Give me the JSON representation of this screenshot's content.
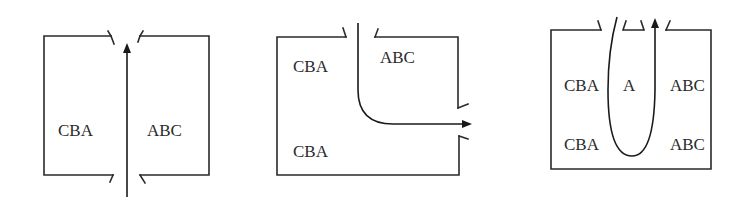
{
  "diagram": {
    "panels": [
      {
        "id": "straight-through",
        "labels": {
          "left": "CBA",
          "right": "ABC"
        },
        "flow": "straight vertical arrow pointing up through top and bottom openings"
      },
      {
        "id": "right-turn",
        "labels": {
          "top_left": "CBA",
          "top_right": "ABC",
          "bottom_left": "CBA"
        },
        "flow": "arrow enters from top opening, curves and exits right-wall opening"
      },
      {
        "id": "u-turn",
        "labels": {
          "left_upper": "CBA",
          "center": "A",
          "right_upper": "ABC",
          "left_lower": "CBA",
          "right_lower": "ABC"
        },
        "flow": "U-shaped loop entering top-left opening and exiting top-right opening with arrow up"
      }
    ],
    "colors": {
      "line": "#2a2a2a",
      "background": "#ffffff"
    }
  }
}
